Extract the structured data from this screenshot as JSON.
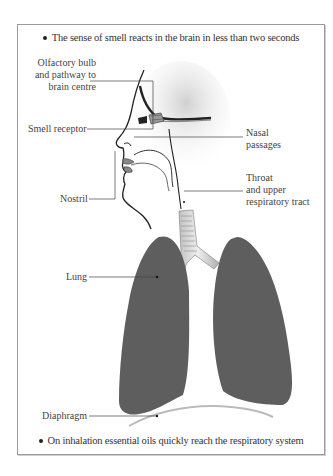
{
  "captions": {
    "top": "The sense of smell reacts in the brain in less than two seconds",
    "bottom": "On inhalation essential oils quickly reach the respiratory system"
  },
  "labels": {
    "olfactory": [
      "Olfactory bulb",
      "and pathway to",
      "brain centre"
    ],
    "smell_receptor": "Smell  receptor",
    "nostril": "Nostril",
    "nasal": [
      "Nasal",
      "passages"
    ],
    "throat": [
      "Throat",
      "and upper",
      "respiratory tract"
    ],
    "lung": "Lung",
    "diaphragm": "Diaphragm"
  },
  "colors": {
    "lung": "#5e5e5e",
    "frame": "#9a9a9a",
    "line": "#333333",
    "text": "#444444"
  }
}
